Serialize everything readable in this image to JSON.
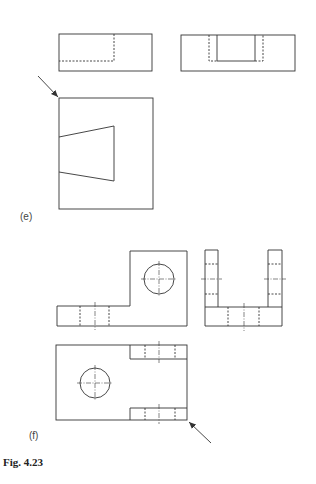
{
  "labels": {
    "e": "(e)",
    "f": "(f)",
    "caption": "Fig. 4.23"
  },
  "colors": {
    "line": "#333333",
    "background": "#ffffff"
  },
  "figure_e": {
    "views": [
      "front-elevation",
      "side-elevation",
      "plan"
    ],
    "arrow": "viewing-direction-arrow"
  },
  "figure_f": {
    "views": [
      "front-elevation",
      "side-elevation",
      "plan"
    ],
    "arrow": "viewing-direction-arrow"
  }
}
